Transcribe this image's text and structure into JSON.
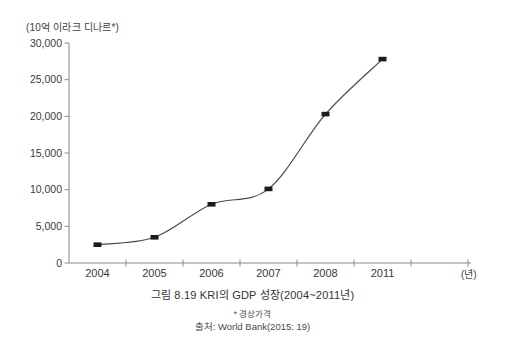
{
  "chart_data": {
    "type": "line",
    "title": "그림 8.19 KRI의 GDP 성장(2004~2011년)",
    "categories": [
      "2004",
      "2005",
      "2006",
      "2007",
      "2008",
      "2011"
    ],
    "values": [
      2500,
      3500,
      8000,
      10100,
      20300,
      27800
    ],
    "xlabel": "(년)",
    "ylabel": "(10억 이라크 디나르*)",
    "ylim": [
      0,
      30000
    ],
    "yticks": [
      0,
      5000,
      10000,
      15000,
      20000,
      25000,
      30000
    ],
    "ytick_labels": [
      "0",
      "5,000",
      "10,000",
      "15,000",
      "20,000",
      "25,000",
      "30,000"
    ],
    "grid": false,
    "legend": "none",
    "marker": "filled-square",
    "line_color": "#4a4a4a",
    "marker_color": "#1c1c1c",
    "axis_color": "#8a8a8a",
    "text_color": "#3a3a3a"
  },
  "caption": {
    "title": "그림 8.19 KRI의 GDP 성장(2004~2011년)",
    "footnote": "* 경상가격",
    "source": "출처: World Bank(2015: 19)"
  }
}
